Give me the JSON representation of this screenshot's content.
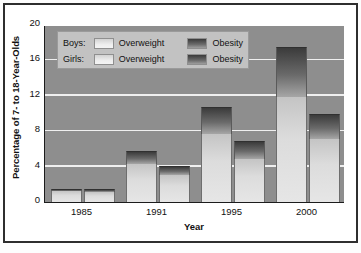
{
  "chart_data": {
    "type": "bar",
    "title": "",
    "xlabel": "Year",
    "ylabel": "Percentage of 7- to 18-Year-Olds",
    "categories": [
      "1985",
      "1991",
      "1995",
      "2000"
    ],
    "ylim": [
      0,
      20
    ],
    "yticks": [
      0,
      4,
      8,
      12,
      16,
      20
    ],
    "grid": true,
    "stacked": true,
    "legend_position": "top-left",
    "legend": [
      {
        "group": "Boys:",
        "entries": [
          "Overweight",
          "Obesity"
        ]
      },
      {
        "group": "Girls:",
        "entries": [
          "Overweight",
          "Obesity"
        ]
      }
    ],
    "series": [
      {
        "name": "Boys Overweight",
        "values": [
          1.2,
          4.3,
          7.7,
          11.9
        ]
      },
      {
        "name": "Boys Obesity",
        "values": [
          0.3,
          1.5,
          3.0,
          5.6
        ]
      },
      {
        "name": "Girls Overweight",
        "values": [
          1.1,
          3.0,
          4.9,
          7.1
        ]
      },
      {
        "name": "Girls Obesity",
        "values": [
          0.4,
          1.1,
          2.0,
          2.8
        ]
      }
    ],
    "totals": [
      {
        "name": "Boys",
        "values": [
          1.5,
          5.8,
          10.7,
          17.5
        ]
      },
      {
        "name": "Girls",
        "values": [
          1.5,
          4.1,
          6.9,
          9.9
        ]
      }
    ]
  },
  "legend": {
    "boys_label": "Boys:",
    "girls_label": "Girls:",
    "overweight_label": "Overweight",
    "obesity_label": "Obesity"
  },
  "axes": {
    "y_title": "Percentage of 7- to 18-Year-Olds",
    "x_title": "Year",
    "y_tick_labels": [
      "20",
      "16",
      "12",
      "8",
      "4",
      "0"
    ],
    "x_tick_labels": [
      "1985",
      "1991",
      "1995",
      "2000"
    ]
  },
  "colors": {
    "plot_background": "#8e8e8e",
    "gridline": "#efefef",
    "overweight": "#dcdcdc",
    "obesity": "#4a4a4a",
    "legend_background": "#c2c2c2",
    "frame": "#2e2e2e",
    "text": "#111111"
  }
}
